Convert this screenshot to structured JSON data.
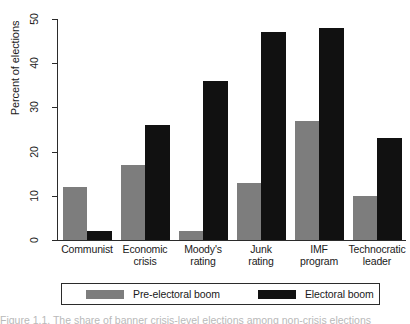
{
  "chart_data": {
    "type": "bar",
    "title": "",
    "xlabel": "",
    "ylabel": "Percent of elections",
    "ylim": [
      0,
      50
    ],
    "yticks": [
      0,
      10,
      20,
      30,
      40,
      50
    ],
    "grid": false,
    "legend_position": "bottom",
    "categories": [
      "Communist",
      "Economic crisis",
      "Moody's rating",
      "Junk rating",
      "IMF program",
      "Technocratic leader"
    ],
    "category_lines": [
      [
        "Communist"
      ],
      [
        "Economic",
        "crisis"
      ],
      [
        "Moody's",
        "rating"
      ],
      [
        "Junk",
        "rating"
      ],
      [
        "IMF",
        "program"
      ],
      [
        "Technocratic",
        "leader"
      ]
    ],
    "series": [
      {
        "name": "Pre-electoral boom",
        "color": "#7d7d7d",
        "values": [
          12,
          17,
          2,
          13,
          27,
          10
        ]
      },
      {
        "name": "Electoral boom",
        "color": "#111111",
        "values": [
          2,
          26,
          36,
          47,
          48,
          23
        ]
      }
    ]
  },
  "axis": {
    "y_title": "Percent of elections",
    "tick_labels": [
      "0",
      "10",
      "20",
      "30",
      "40",
      "50"
    ]
  },
  "legend": {
    "items": [
      {
        "label": "Pre-electoral boom",
        "color": "#7d7d7d"
      },
      {
        "label": "Electoral boom",
        "color": "#111111"
      }
    ]
  },
  "caption": {
    "text": "Figure 1.1. The share of banner crisis-level elections among non-crisis elections"
  }
}
